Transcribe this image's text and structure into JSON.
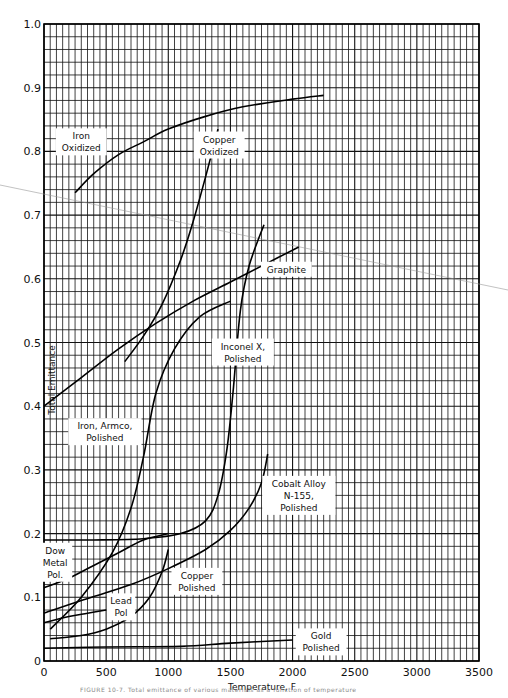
{
  "chart_data": {
    "type": "line",
    "title": "",
    "xlabel": "Temperature, F",
    "ylabel": "Total Emittance",
    "xlim": [
      0,
      3500
    ],
    "ylim": [
      0,
      1.0
    ],
    "grid": true,
    "legend_position": "inline labels",
    "x_ticks": [
      "0",
      "500",
      "1000",
      "1500",
      "2000",
      "2500",
      "3000",
      "3500"
    ],
    "y_ticks": [
      "0",
      "0.1",
      "0.2",
      "0.3",
      "0.4",
      "0.5",
      "0.6",
      "0.7",
      "0.8",
      "0.9",
      "1.0"
    ],
    "series": [
      {
        "name": "Iron Oxidized",
        "label_lines": [
          "Iron",
          "Oxidized"
        ],
        "label_at": [
          300,
          0.815
        ],
        "x": [
          250,
          400,
          600,
          800,
          1000,
          1300,
          1600,
          2000,
          2250
        ],
        "values": [
          0.735,
          0.765,
          0.795,
          0.815,
          0.835,
          0.855,
          0.87,
          0.882,
          0.888
        ]
      },
      {
        "name": "Copper Oxidized",
        "label_lines": [
          "Copper",
          "Oxidized"
        ],
        "label_at": [
          1410,
          0.81
        ],
        "x": [
          650,
          800,
          950,
          1100,
          1200,
          1300,
          1400
        ],
        "values": [
          0.47,
          0.51,
          0.56,
          0.63,
          0.69,
          0.76,
          0.835
        ]
      },
      {
        "name": "Graphite",
        "label_lines": [
          "Graphite"
        ],
        "label_at": [
          1950,
          0.615
        ],
        "x": [
          0,
          300,
          600,
          900,
          1200,
          1500,
          1800,
          2050
        ],
        "values": [
          0.4,
          0.445,
          0.49,
          0.53,
          0.565,
          0.595,
          0.625,
          0.65
        ]
      },
      {
        "name": "Inconel X, Polished",
        "label_lines": [
          "Inconel X,",
          "Polished"
        ],
        "label_at": [
          1600,
          0.485
        ],
        "x": [
          0,
          400,
          800,
          1100,
          1300,
          1400,
          1470,
          1520,
          1580,
          1650,
          1770
        ],
        "values": [
          0.19,
          0.19,
          0.192,
          0.2,
          0.22,
          0.26,
          0.33,
          0.42,
          0.55,
          0.62,
          0.685
        ]
      },
      {
        "name": "Iron, Armco, Polished",
        "label_lines": [
          "Iron, Armco,",
          "Polished"
        ],
        "label_at": [
          490,
          0.36
        ],
        "x": [
          50,
          300,
          550,
          700,
          800,
          900,
          1050,
          1250,
          1500
        ],
        "values": [
          0.05,
          0.1,
          0.17,
          0.24,
          0.32,
          0.42,
          0.49,
          0.54,
          0.565
        ]
      },
      {
        "name": "Cobalt Alloy N-155, Polished",
        "label_lines": [
          "Cobalt Alloy",
          "N-155,",
          "Polished"
        ],
        "label_at": [
          2050,
          0.26
        ],
        "x": [
          0,
          300,
          700,
          1000,
          1300,
          1500,
          1650,
          1750,
          1800
        ],
        "values": [
          0.075,
          0.095,
          0.12,
          0.145,
          0.175,
          0.205,
          0.24,
          0.28,
          0.325
        ]
      },
      {
        "name": "Dow Metal Pol.",
        "label_lines": [
          "Dow",
          "Metal",
          "Pol."
        ],
        "label_at": [
          90,
          0.155
        ],
        "x": [
          0,
          200,
          400,
          600,
          800,
          1000
        ],
        "values": [
          0.115,
          0.13,
          0.15,
          0.17,
          0.19,
          0.2
        ]
      },
      {
        "name": "Copper Polished",
        "label_lines": [
          "Copper",
          "Polished"
        ],
        "label_at": [
          1230,
          0.125
        ],
        "x": [
          50,
          300,
          500,
          700,
          850,
          950,
          1000
        ],
        "values": [
          0.035,
          0.04,
          0.05,
          0.07,
          0.1,
          0.14,
          0.175
        ]
      },
      {
        "name": "Lead Pol",
        "label_lines": [
          "Lead",
          "Pol"
        ],
        "label_at": [
          620,
          0.085
        ],
        "x": [
          0,
          200,
          350,
          500
        ],
        "values": [
          0.06,
          0.07,
          0.075,
          0.08
        ]
      },
      {
        "name": "Gold Polished",
        "label_lines": [
          "Gold",
          "Polished"
        ],
        "label_at": [
          2230,
          0.03
        ],
        "x": [
          0,
          500,
          1100,
          1500,
          2000
        ],
        "values": [
          0.02,
          0.022,
          0.023,
          0.028,
          0.033
        ]
      }
    ]
  },
  "caption": "FIGURE 10-7. Total emittance of various materials as a function of temperature"
}
